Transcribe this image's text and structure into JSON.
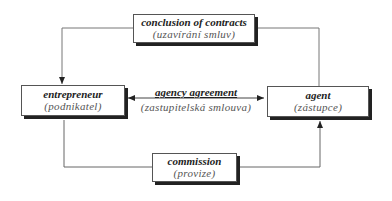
{
  "diagram": {
    "nodes": {
      "contracts": {
        "title": "conclusion of contracts",
        "subtitle": "(uzavírání smluv)"
      },
      "entrepreneur": {
        "title": "entrepreneur",
        "subtitle": "(podnikatel)"
      },
      "agent": {
        "title": "agent",
        "subtitle": "(zástupce)"
      },
      "commission": {
        "title": "commission",
        "subtitle": "(provize)"
      }
    },
    "center_relation": {
      "title": "agency agreement",
      "subtitle": "(zastupitelská smlouva)"
    },
    "edges": [
      {
        "from": "agent",
        "to": "contracts",
        "style": "line"
      },
      {
        "from": "contracts",
        "to": "entrepreneur",
        "style": "arrow"
      },
      {
        "from": "entrepreneur",
        "to": "agent",
        "style": "double-arrow",
        "label": "agency agreement"
      },
      {
        "from": "entrepreneur",
        "to": "commission",
        "style": "line"
      },
      {
        "from": "commission",
        "to": "agent",
        "style": "arrow"
      }
    ],
    "colors": {
      "line": "#666666",
      "shadow": "#222222",
      "text": "#222222",
      "subtext": "#555555"
    }
  }
}
